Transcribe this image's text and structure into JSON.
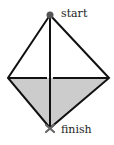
{
  "diagram": {
    "labels": {
      "start": "start",
      "finish": "finish"
    },
    "vertices": {
      "top": [
        50,
        15
      ],
      "left": [
        8,
        78
      ],
      "right": [
        109,
        78
      ],
      "bottom": [
        50,
        128
      ]
    },
    "colors": {
      "stroke": "#111111",
      "fill_lower": "#cccccc",
      "start_marker": "#555555",
      "finish_marker": "#666666"
    }
  }
}
